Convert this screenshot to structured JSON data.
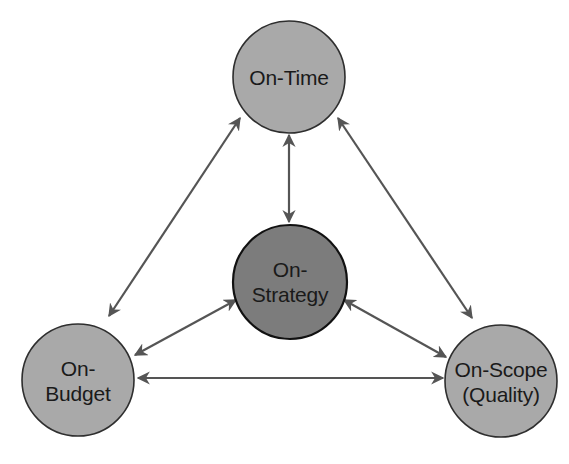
{
  "diagram": {
    "type": "triangle-relationship",
    "colors": {
      "node_fill": "#a9a9a9",
      "center_fill": "#7c7c7c",
      "stroke": "#2e2e2e",
      "arrow": "#555555",
      "text": "#1a1a1a",
      "background": "#ffffff"
    },
    "nodes": {
      "on_time": {
        "line1": "On-Time",
        "line2": ""
      },
      "on_strategy": {
        "line1": "On-",
        "line2": "Strategy"
      },
      "on_budget": {
        "line1": "On-",
        "line2": "Budget"
      },
      "on_scope": {
        "line1": "On-Scope",
        "line2": "(Quality)"
      }
    },
    "edges": [
      {
        "from": "On-Time",
        "to": "On-Strategy",
        "direction": "bidirectional"
      },
      {
        "from": "On-Time",
        "to": "On-Budget",
        "direction": "bidirectional"
      },
      {
        "from": "On-Time",
        "to": "On-Scope (Quality)",
        "direction": "bidirectional"
      },
      {
        "from": "On-Strategy",
        "to": "On-Budget",
        "direction": "bidirectional"
      },
      {
        "from": "On-Strategy",
        "to": "On-Scope (Quality)",
        "direction": "bidirectional"
      },
      {
        "from": "On-Budget",
        "to": "On-Scope (Quality)",
        "direction": "bidirectional"
      }
    ]
  }
}
